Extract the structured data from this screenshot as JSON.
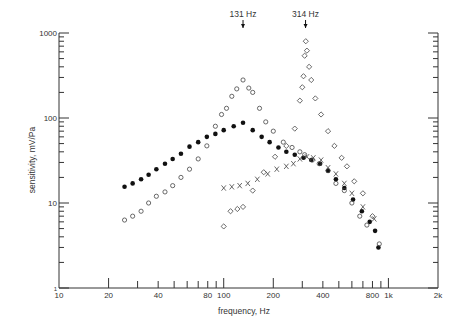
{
  "chart_data": {
    "type": "scatter",
    "title": "",
    "xlabel": "frequency, Hz",
    "ylabel": "sensitivity, mV/Pa",
    "xscale": "log",
    "yscale": "log",
    "xlim": [
      10,
      2000
    ],
    "ylim": [
      1,
      1000
    ],
    "grid": false,
    "legend": null,
    "x_ticks": [
      {
        "value": 10,
        "label": "10"
      },
      {
        "value": 20,
        "label": "20"
      },
      {
        "value": 40,
        "label": "40"
      },
      {
        "value": 80,
        "label": "80"
      },
      {
        "value": 100,
        "label": "100"
      },
      {
        "value": 200,
        "label": "200"
      },
      {
        "value": 400,
        "label": "400"
      },
      {
        "value": 800,
        "label": "800"
      },
      {
        "value": 1000,
        "label": "1k"
      },
      {
        "value": 2000,
        "label": "2k"
      }
    ],
    "x_minor_ticks": [
      30,
      50,
      60,
      70,
      90,
      300,
      500,
      600,
      700,
      900
    ],
    "y_ticks": [
      {
        "value": 1,
        "label": "1"
      },
      {
        "value": 10,
        "label": "10"
      },
      {
        "value": 100,
        "label": "100"
      },
      {
        "value": 1000,
        "label": "1000"
      }
    ],
    "annotations": [
      {
        "text": "131 Hz",
        "x": 131,
        "arrow": "down"
      },
      {
        "text": "314 Hz",
        "x": 314,
        "arrow": "down"
      }
    ],
    "series": [
      {
        "name": "filled circles",
        "marker": "filled-circle",
        "points": [
          [
            25,
            15.5
          ],
          [
            28,
            17
          ],
          [
            31.5,
            19
          ],
          [
            35,
            21.5
          ],
          [
            39,
            25
          ],
          [
            44,
            29
          ],
          [
            49,
            33
          ],
          [
            55,
            38
          ],
          [
            62,
            46
          ],
          [
            70,
            52
          ],
          [
            79,
            60
          ],
          [
            89,
            65
          ],
          [
            100,
            72
          ],
          [
            115,
            80
          ],
          [
            131,
            88
          ],
          [
            150,
            72
          ],
          [
            170,
            60
          ],
          [
            190,
            52
          ],
          [
            215,
            45
          ],
          [
            240,
            40
          ],
          [
            270,
            37
          ],
          [
            305,
            34
          ],
          [
            340,
            32
          ],
          [
            385,
            29
          ],
          [
            430,
            24
          ],
          [
            480,
            19
          ],
          [
            540,
            15
          ],
          [
            610,
            11
          ],
          [
            690,
            8
          ],
          [
            770,
            6
          ],
          [
            830,
            4.7
          ],
          [
            870,
            3
          ]
        ]
      },
      {
        "name": "open circles",
        "marker": "open-circle",
        "points": [
          [
            25,
            6.3
          ],
          [
            28,
            7
          ],
          [
            31.5,
            8
          ],
          [
            35,
            10
          ],
          [
            39,
            12
          ],
          [
            44,
            13.5
          ],
          [
            49,
            16
          ],
          [
            55,
            20
          ],
          [
            62,
            25
          ],
          [
            70,
            33
          ],
          [
            79,
            47
          ],
          [
            89,
            80
          ],
          [
            97,
            110
          ],
          [
            104,
            130
          ],
          [
            112,
            180
          ],
          [
            120,
            220
          ],
          [
            131,
            280
          ],
          [
            142,
            225
          ],
          [
            150,
            200
          ],
          [
            165,
            130
          ],
          [
            180,
            90
          ],
          [
            200,
            70
          ],
          [
            230,
            52
          ],
          [
            260,
            45
          ],
          [
            290,
            40
          ],
          [
            310,
            37
          ],
          [
            345,
            32
          ],
          [
            380,
            29
          ],
          [
            430,
            24
          ],
          [
            480,
            17
          ],
          [
            540,
            14
          ],
          [
            600,
            10
          ],
          [
            670,
            7
          ],
          [
            740,
            5.5
          ],
          [
            880,
            3.3
          ]
        ]
      },
      {
        "name": "crosses",
        "marker": "x",
        "points": [
          [
            100,
            15
          ],
          [
            112,
            15.5
          ],
          [
            125,
            16
          ],
          [
            140,
            17
          ],
          [
            160,
            19
          ],
          [
            185,
            22
          ],
          [
            210,
            25
          ],
          [
            240,
            27
          ],
          [
            265,
            29
          ],
          [
            290,
            33
          ],
          [
            320,
            35
          ],
          [
            350,
            34
          ],
          [
            390,
            32
          ],
          [
            430,
            26
          ],
          [
            480,
            22
          ],
          [
            540,
            17
          ],
          [
            600,
            13
          ],
          [
            700,
            9
          ],
          [
            820,
            6.5
          ]
        ]
      },
      {
        "name": "diamonds",
        "marker": "open-diamond",
        "points": [
          [
            100,
            5.3
          ],
          [
            110,
            8
          ],
          [
            121,
            8.5
          ],
          [
            131,
            9
          ],
          [
            150,
            14
          ],
          [
            175,
            23
          ],
          [
            205,
            35
          ],
          [
            240,
            47
          ],
          [
            270,
            75
          ],
          [
            290,
            160
          ],
          [
            300,
            230
          ],
          [
            305,
            310
          ],
          [
            310,
            540
          ],
          [
            315,
            800
          ],
          [
            320,
            620
          ],
          [
            330,
            400
          ],
          [
            340,
            280
          ],
          [
            360,
            170
          ],
          [
            390,
            110
          ],
          [
            430,
            70
          ],
          [
            470,
            47
          ],
          [
            520,
            34
          ],
          [
            560,
            27
          ],
          [
            620,
            18
          ],
          [
            700,
            13
          ],
          [
            800,
            7
          ]
        ]
      }
    ]
  },
  "axes": {
    "xlabel": "frequency, Hz",
    "ylabel": "sensitivity, mV/Pa"
  }
}
